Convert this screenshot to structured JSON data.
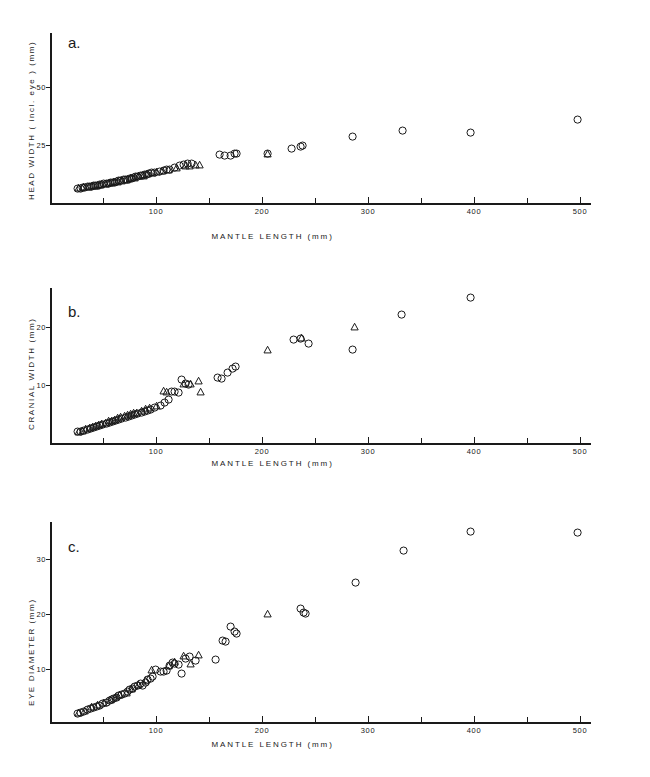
{
  "figure": {
    "background": "#ffffff",
    "ink": "#1a1a1a",
    "panel_count": 3
  },
  "chart_data": [
    {
      "type": "scatter",
      "panel_label": "a.",
      "title": "",
      "xlabel": "MANTLE LENGTH (mm)",
      "ylabel": "HEAD WIDTH ( incl. eye ) (mm)",
      "xlim": [
        0,
        510
      ],
      "ylim": [
        0,
        62
      ],
      "grid": false,
      "legend": "none",
      "xticks_major": [
        100,
        200,
        300,
        400,
        500
      ],
      "xticks_minor": [
        50,
        150,
        250,
        350,
        450
      ],
      "xticklabels": [
        "100",
        "200",
        "300",
        "400",
        "500"
      ],
      "yticks": [
        25,
        50
      ],
      "yticklabels": [
        "25",
        "50"
      ],
      "series": [
        {
          "name": "circle-group",
          "marker": "circle",
          "points": [
            [
              26,
              6.2
            ],
            [
              29,
              6.4
            ],
            [
              31,
              6.5
            ],
            [
              33,
              6.6
            ],
            [
              35,
              6.9
            ],
            [
              37,
              7.0
            ],
            [
              39,
              7.2
            ],
            [
              41,
              7.3
            ],
            [
              43,
              7.4
            ],
            [
              45,
              7.6
            ],
            [
              47,
              7.8
            ],
            [
              49,
              7.9
            ],
            [
              51,
              8.2
            ],
            [
              53,
              8.3
            ],
            [
              55,
              8.5
            ],
            [
              57,
              8.7
            ],
            [
              59,
              8.9
            ],
            [
              61,
              9.0
            ],
            [
              63,
              9.3
            ],
            [
              65,
              9.5
            ],
            [
              67,
              9.6
            ],
            [
              69,
              9.9
            ],
            [
              71,
              10.1
            ],
            [
              73,
              10.3
            ],
            [
              75,
              10.5
            ],
            [
              77,
              10.7
            ],
            [
              79,
              10.9
            ],
            [
              81,
              11.2
            ],
            [
              83,
              11.4
            ],
            [
              85,
              11.7
            ],
            [
              87,
              11.9
            ],
            [
              89,
              12.1
            ],
            [
              91,
              12.4
            ],
            [
              93,
              12.6
            ],
            [
              96,
              12.9
            ],
            [
              99,
              13.2
            ],
            [
              103,
              13.6
            ],
            [
              107,
              14.0
            ],
            [
              110,
              14.3
            ],
            [
              113,
              14.6
            ],
            [
              118,
              15.2
            ],
            [
              122,
              16.0
            ],
            [
              126,
              16.6
            ],
            [
              130,
              17.1
            ],
            [
              134,
              16.8
            ],
            [
              160,
              20.8
            ],
            [
              165,
              20.3
            ],
            [
              170,
              20.6
            ],
            [
              174,
              21.4
            ],
            [
              176,
              21.5
            ],
            [
              205,
              21.4
            ],
            [
              228,
              23.4
            ],
            [
              236,
              24.3
            ],
            [
              238,
              24.6
            ],
            [
              285,
              28.6
            ],
            [
              333,
              31.2
            ],
            [
              397,
              30.3
            ],
            [
              498,
              35.8
            ]
          ]
        },
        {
          "name": "triangle-group",
          "marker": "triangle",
          "points": [
            [
              27,
              6.8
            ],
            [
              32,
              7.0
            ],
            [
              36,
              7.2
            ],
            [
              40,
              7.5
            ],
            [
              44,
              7.7
            ],
            [
              48,
              8.0
            ],
            [
              52,
              8.4
            ],
            [
              56,
              8.7
            ],
            [
              60,
              9.1
            ],
            [
              64,
              9.4
            ],
            [
              68,
              9.8
            ],
            [
              72,
              10.2
            ],
            [
              76,
              10.8
            ],
            [
              80,
              11.0
            ],
            [
              84,
              11.6
            ],
            [
              88,
              12.0
            ],
            [
              92,
              12.5
            ],
            [
              97,
              13.0
            ],
            [
              101,
              13.4
            ],
            [
              106,
              13.9
            ],
            [
              112,
              14.4
            ],
            [
              119,
              15.4
            ],
            [
              128,
              16.2
            ],
            [
              132,
              16.3
            ],
            [
              137,
              16.5
            ],
            [
              141,
              16.4
            ],
            [
              205,
              21.3
            ]
          ]
        }
      ]
    },
    {
      "type": "scatter",
      "panel_label": "b.",
      "title": "",
      "xlabel": "MANTLE LENGTH (mm)",
      "ylabel": "CRANIAL WIDTH (mm)",
      "xlim": [
        0,
        510
      ],
      "ylim": [
        0,
        25.5
      ],
      "grid": false,
      "legend": "none",
      "xticks_major": [
        100,
        200,
        300,
        400,
        500
      ],
      "xticks_minor": [
        50,
        150,
        250,
        350,
        450
      ],
      "xticklabels": [
        "100",
        "200",
        "300",
        "400",
        "500"
      ],
      "yticks": [
        10,
        20
      ],
      "yticklabels": [
        "10",
        "20"
      ],
      "series": [
        {
          "name": "circle-group",
          "marker": "circle",
          "points": [
            [
              26,
              1.9
            ],
            [
              29,
              2.0
            ],
            [
              32,
              2.1
            ],
            [
              35,
              2.3
            ],
            [
              38,
              2.5
            ],
            [
              41,
              2.6
            ],
            [
              44,
              2.8
            ],
            [
              47,
              3.0
            ],
            [
              50,
              3.2
            ],
            [
              53,
              3.4
            ],
            [
              56,
              3.5
            ],
            [
              59,
              3.7
            ],
            [
              62,
              3.9
            ],
            [
              65,
              4.0
            ],
            [
              68,
              4.2
            ],
            [
              71,
              4.4
            ],
            [
              74,
              4.6
            ],
            [
              77,
              4.7
            ],
            [
              80,
              4.9
            ],
            [
              83,
              5.1
            ],
            [
              86,
              5.3
            ],
            [
              89,
              5.4
            ],
            [
              92,
              5.6
            ],
            [
              95,
              5.8
            ],
            [
              99,
              6.1
            ],
            [
              104,
              6.5
            ],
            [
              108,
              7.0
            ],
            [
              112,
              7.5
            ],
            [
              115,
              8.8
            ],
            [
              118,
              8.9
            ],
            [
              121,
              8.7
            ],
            [
              124,
              10.9
            ],
            [
              128,
              10.2
            ],
            [
              131,
              10.1
            ],
            [
              158,
              11.2
            ],
            [
              162,
              11.1
            ],
            [
              168,
              12.1
            ],
            [
              172,
              12.8
            ],
            [
              175,
              13.2
            ],
            [
              230,
              17.9
            ],
            [
              236,
              18.0
            ],
            [
              244,
              17.1
            ],
            [
              285,
              16.1
            ],
            [
              332,
              22.2
            ],
            [
              397,
              25.0
            ]
          ]
        },
        {
          "name": "triangle-group",
          "marker": "triangle",
          "points": [
            [
              27,
              2.0
            ],
            [
              31,
              2.2
            ],
            [
              34,
              2.4
            ],
            [
              37,
              2.6
            ],
            [
              40,
              2.8
            ],
            [
              43,
              3.0
            ],
            [
              46,
              3.2
            ],
            [
              49,
              3.4
            ],
            [
              52,
              3.6
            ],
            [
              55,
              3.8
            ],
            [
              58,
              3.9
            ],
            [
              61,
              4.1
            ],
            [
              64,
              4.3
            ],
            [
              67,
              4.5
            ],
            [
              70,
              4.7
            ],
            [
              73,
              4.9
            ],
            [
              76,
              5.0
            ],
            [
              79,
              5.2
            ],
            [
              82,
              5.3
            ],
            [
              86,
              5.6
            ],
            [
              90,
              5.9
            ],
            [
              94,
              6.1
            ],
            [
              101,
              6.4
            ],
            [
              107,
              9.0
            ],
            [
              110,
              8.9
            ],
            [
              126,
              10.3
            ],
            [
              133,
              10.2
            ],
            [
              140,
              10.7
            ],
            [
              142,
              8.9
            ],
            [
              205,
              16.1
            ],
            [
              237,
              18.2
            ],
            [
              287,
              20.0
            ]
          ]
        }
      ]
    },
    {
      "type": "scatter",
      "panel_label": "c.",
      "title": "",
      "xlabel": "MANTLE LENGTH (mm)",
      "ylabel": "EYE DIAMETER (mm)",
      "xlim": [
        0,
        510
      ],
      "ylim": [
        0,
        38
      ],
      "grid": false,
      "legend": "none",
      "xticks_major": [
        100,
        200,
        300,
        400,
        500
      ],
      "xticks_minor": [
        50,
        150,
        250,
        350,
        450
      ],
      "xticklabels": [
        "100",
        "200",
        "300",
        "400",
        "500"
      ],
      "yticks": [
        10,
        20,
        30
      ],
      "yticklabels": [
        "10",
        "20",
        "30"
      ],
      "series": [
        {
          "name": "circle-group",
          "marker": "circle",
          "points": [
            [
              26,
              1.9
            ],
            [
              29,
              2.1
            ],
            [
              32,
              2.3
            ],
            [
              35,
              2.6
            ],
            [
              38,
              2.8
            ],
            [
              41,
              3.0
            ],
            [
              44,
              3.2
            ],
            [
              47,
              3.4
            ],
            [
              50,
              3.7
            ],
            [
              53,
              3.9
            ],
            [
              56,
              4.2
            ],
            [
              58,
              4.4
            ],
            [
              60,
              4.6
            ],
            [
              63,
              4.8
            ],
            [
              65,
              5.1
            ],
            [
              68,
              5.4
            ],
            [
              70,
              5.6
            ],
            [
              73,
              5.9
            ],
            [
              75,
              6.2
            ],
            [
              78,
              6.5
            ],
            [
              80,
              6.8
            ],
            [
              83,
              7.0
            ],
            [
              85,
              7.3
            ],
            [
              87,
              7.0
            ],
            [
              90,
              7.6
            ],
            [
              92,
              8.0
            ],
            [
              95,
              8.3
            ],
            [
              97,
              8.6
            ],
            [
              100,
              9.9
            ],
            [
              104,
              9.6
            ],
            [
              107,
              9.5
            ],
            [
              110,
              9.7
            ],
            [
              113,
              10.6
            ],
            [
              116,
              11.1
            ],
            [
              118,
              11.0
            ],
            [
              121,
              10.8
            ],
            [
              124,
              9.1
            ],
            [
              128,
              11.9
            ],
            [
              132,
              12.2
            ],
            [
              137,
              11.5
            ],
            [
              156,
              11.8
            ],
            [
              163,
              15.1
            ],
            [
              166,
              15.0
            ],
            [
              170,
              17.8
            ],
            [
              174,
              16.8
            ],
            [
              176,
              16.5
            ],
            [
              236,
              20.9
            ],
            [
              239,
              20.2
            ],
            [
              241,
              20.1
            ],
            [
              288,
              25.8
            ],
            [
              334,
              31.6
            ],
            [
              397,
              34.9
            ],
            [
              498,
              34.8
            ]
          ]
        },
        {
          "name": "triangle-group",
          "marker": "triangle",
          "points": [
            [
              27,
              2.0
            ],
            [
              33,
              2.5
            ],
            [
              39,
              3.1
            ],
            [
              45,
              3.5
            ],
            [
              51,
              3.9
            ],
            [
              57,
              4.5
            ],
            [
              62,
              5.0
            ],
            [
              66,
              5.3
            ],
            [
              72,
              5.8
            ],
            [
              77,
              6.4
            ],
            [
              84,
              7.2
            ],
            [
              90,
              7.9
            ],
            [
              96,
              9.9
            ],
            [
              112,
              10.7
            ],
            [
              118,
              11.4
            ],
            [
              126,
              12.4
            ],
            [
              133,
              11.0
            ],
            [
              140,
              12.6
            ],
            [
              205,
              20.1
            ]
          ]
        }
      ]
    }
  ]
}
